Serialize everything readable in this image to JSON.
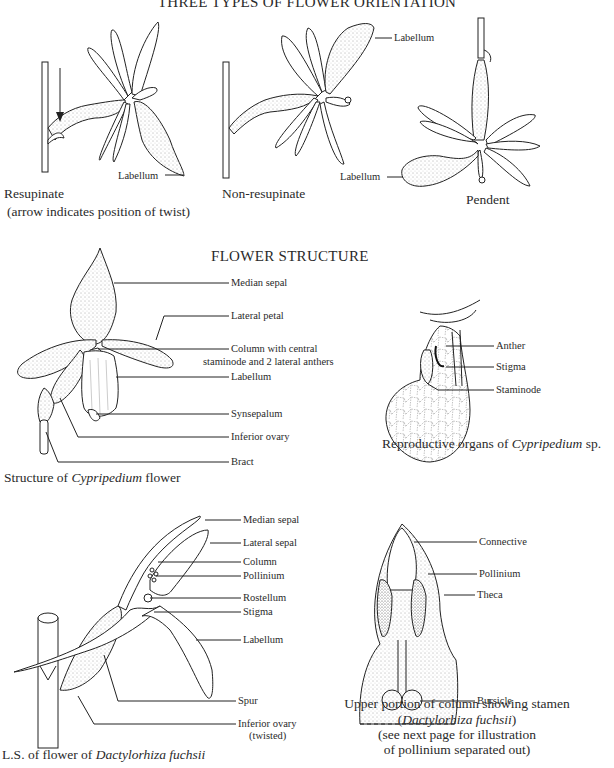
{
  "sections": {
    "orientation": {
      "title": "THREE TYPES OF FLOWER ORIENTATION",
      "figures": [
        {
          "name": "resupinate",
          "caption": "Resupinate",
          "subcaption": "(arrow indicates position of twist)",
          "labels": [
            "Labellum"
          ]
        },
        {
          "name": "non-resupinate",
          "caption": "Non-resupinate",
          "labels": [
            "Labellum"
          ]
        },
        {
          "name": "pendent",
          "caption": "Pendent",
          "labels": [
            "Labellum"
          ]
        }
      ]
    },
    "structure": {
      "title": "FLOWER STRUCTURE",
      "cypripedium": {
        "caption_prefix": "Structure of ",
        "caption_italic": "Cypripedium",
        "caption_suffix": " flower",
        "labels": {
          "median_sepal": "Median sepal",
          "lateral_petal": "Lateral petal",
          "column_line1": "Column with central",
          "column_line2": "staminode and 2 lateral anthers",
          "labellum": "Labellum",
          "synsepalum": "Synsepalum",
          "inferior_ovary": "Inferior ovary",
          "bract": "Bract"
        }
      },
      "reproductive": {
        "caption_prefix": "Reproductive organs of ",
        "caption_italic": "Cypripedium",
        "caption_suffix": " sp.",
        "labels": {
          "anther": "Anther",
          "stigma": "Stigma",
          "staminode": "Staminode"
        }
      },
      "dactylorhiza": {
        "caption_prefix": "L.S. of flower of ",
        "caption_italic": "Dactylorhiza fuchsii",
        "labels": {
          "median_sepal": "Median sepal",
          "lateral_sepal": "Lateral sepal",
          "column": "Column",
          "pollinium": "Pollinium",
          "rostellum": "Rostellum",
          "stigma": "Stigma",
          "labellum": "Labellum",
          "spur": "Spur",
          "inferior_ovary_line1": "Inferior ovary",
          "inferior_ovary_line2": "(twisted)"
        }
      },
      "stamen": {
        "caption_line1": "Upper portion of column showing stamen",
        "caption_line2_italic": "Dactylorhiza fuchsii",
        "caption_line3": "(see next page for illustration",
        "caption_line4": "of pollinium separated out)",
        "labels": {
          "connective": "Connective",
          "pollinium": "Pollinium",
          "theca": "Theca",
          "bursicle": "Bursicle"
        }
      }
    }
  }
}
